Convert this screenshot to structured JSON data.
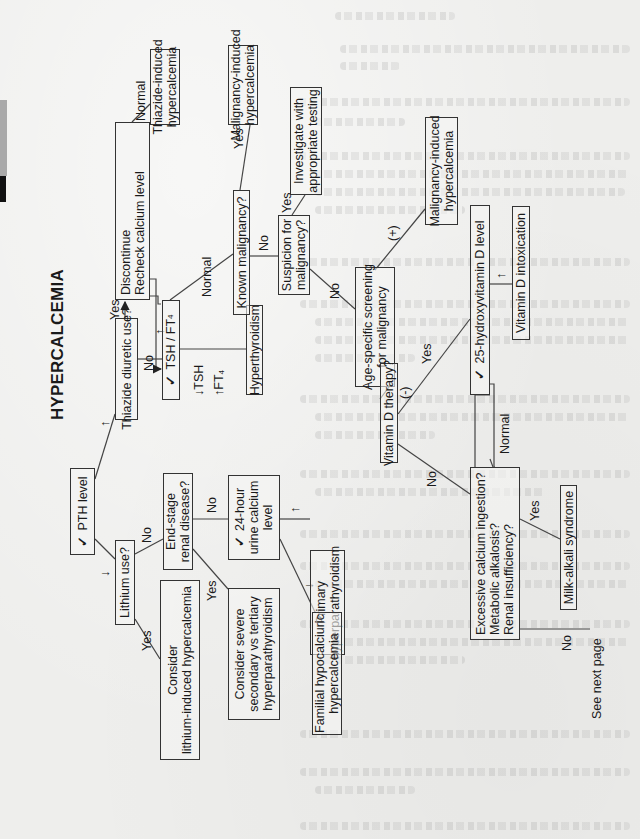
{
  "page": {
    "edge_tabs": [
      "gray-tab",
      "black-tab"
    ]
  },
  "flowchart": {
    "title": "HYPERCALCEMIA",
    "check_mark": "✓",
    "nodes": {
      "pth_level": "PTH level",
      "lithium_use": "Lithium use?",
      "consider_lithium": [
        "Consider",
        "lithium-induced hypercalcemia"
      ],
      "thiazide_use": "Thiazide diuretic use?",
      "discontinue": [
        "Discontinue",
        "Recheck calcium level"
      ],
      "thiazide_induced": [
        "Thiazide-induced",
        "hypercalcemia"
      ],
      "tsh_ft4": "TSH / FT",
      "tsh_ft4_sub": "4",
      "hyperthyroidism": "Hyperthyroidism",
      "end_stage_renal": [
        "End-stage",
        "renal disease?"
      ],
      "consider_severe": [
        "Consider severe",
        "secondary vs tertiary",
        "hyperparathyroidism"
      ],
      "urine_calcium": [
        "24-hour",
        "urine calcium",
        "level"
      ],
      "primary_hyperpara": [
        "Primary",
        "hyperparathyroidism"
      ],
      "familial_hypocalciuric": [
        "Familial hypocalciuric",
        "hypercalcemia"
      ],
      "known_malignancy": "Known malignancy?",
      "malignancy_induced_top": [
        "Malignancy-induced",
        "hypercalcemia"
      ],
      "suspicion_malignancy": [
        "Suspicion for",
        "malignancy?"
      ],
      "investigate": [
        "Investigate with",
        "appropriate testing"
      ],
      "age_specific": [
        "Age-specific screening",
        "for malignancy"
      ],
      "malignancy_induced_right": [
        "Malignancy-induced",
        "hypercalcemia"
      ],
      "vitamin_d_therapy": "Vitamin D therapy?",
      "hydroxyvitamin_d": "25-hydroxyvitamin D level",
      "vitamin_d_intoxication": "Vitamin D intoxication",
      "excessive_calcium": [
        "Excessive calcium ingestion?",
        "Metabolic alkalosis?",
        "Renal insufficiency?"
      ],
      "milk_alkali": "Milk-alkali syndrome",
      "see_next_page": "See next page"
    },
    "edge_labels": {
      "lithium_yes": "Yes",
      "lithium_no": "No",
      "thiazide_yes": "Yes",
      "thiazide_no": "No",
      "discontinue_normal": "Normal",
      "tsh_normal": "Normal",
      "tsh_low": "TSH",
      "ft4_high": "FT",
      "ft4_sub": "4",
      "arrow_down": "↓",
      "arrow_up": "↑",
      "renal_yes": "Yes",
      "renal_no": "No",
      "known_yes": "Yes",
      "known_no": "No",
      "suspicion_yes": "Yes",
      "suspicion_no": "No",
      "screen_pos": "(+)",
      "screen_neg": "(-)",
      "vitd_yes": "Yes",
      "vitd_no": "No",
      "hydroxy_normal": "Normal",
      "excess_yes": "Yes",
      "excess_no": "No",
      "pth_low": "↓",
      "pth_high": "↑",
      "urine_high": "↑",
      "urine_low": "↓",
      "hydroxy_high": "↑",
      "recheck_high": "↑"
    }
  },
  "bleed_through": {
    "lines": [
      "sodium bicarbonate",
      "lithium therapy should be considered, however, if the patient is",
      "refractory",
      "partially investigate with ultrasound imaging and tc-sestamibi",
      "parathyroid",
      "Familial hypocalciuric hypercalcemia is caused by an inherited",
      "autosomal dominant mutation"
    ]
  }
}
